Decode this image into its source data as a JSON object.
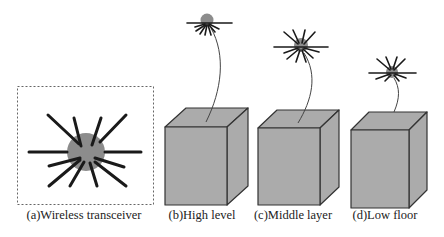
{
  "figure": {
    "panels": [
      {
        "id": "a",
        "caption": "(a)Wireless transceiver",
        "caption_x": 84
      },
      {
        "id": "b",
        "caption": "(b)High level",
        "caption_x": 202
      },
      {
        "id": "c",
        "caption": "(c)Middle layer",
        "caption_x": 293
      },
      {
        "id": "d",
        "caption": "(d)Low floor",
        "caption_x": 385
      }
    ],
    "colors": {
      "cube_face": "#ababab",
      "cube_edge": "#333333",
      "transceiver_body": "#8c8c8c",
      "antenna": "#1a1a1a",
      "cable": "#444444",
      "frame_dash": "#555555"
    }
  }
}
